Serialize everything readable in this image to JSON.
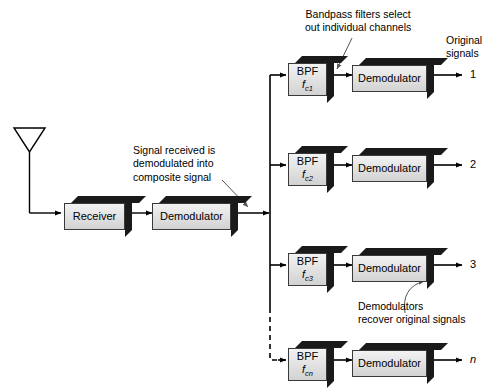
{
  "diagram": {
    "annotations": [
      {
        "id": "bandpass-note",
        "lines": [
          "Bandpass filters select",
          "out individual channels"
        ]
      },
      {
        "id": "original-signals-note",
        "lines": [
          "Original",
          "signals"
        ]
      },
      {
        "id": "received-signal-note",
        "lines": [
          "Signal received is",
          "demodulated into",
          "composite signal"
        ]
      },
      {
        "id": "demodulators-note",
        "lines": [
          "Demodulators",
          "recover original signals"
        ]
      }
    ],
    "blocks": {
      "receiver": {
        "label": "Receiver"
      },
      "main_demodulator": {
        "label": "Demodulator"
      }
    },
    "channels": [
      {
        "bpf_label": "BPF",
        "bpf_freq": "f",
        "bpf_freq_sub": "c1",
        "demodulator_label": "Demodulator",
        "output": "1",
        "output_italic": false,
        "dashed": false
      },
      {
        "bpf_label": "BPF",
        "bpf_freq": "f",
        "bpf_freq_sub": "c2",
        "demodulator_label": "Demodulator",
        "output": "2",
        "output_italic": false,
        "dashed": false
      },
      {
        "bpf_label": "BPF",
        "bpf_freq": "f",
        "bpf_freq_sub": "c3",
        "demodulator_label": "Demodulator",
        "output": "3",
        "output_italic": false,
        "dashed": false
      },
      {
        "bpf_label": "BPF",
        "bpf_freq": "f",
        "bpf_freq_sub": "cn",
        "demodulator_label": "Demodulator",
        "output": "n",
        "output_italic": true,
        "dashed": true
      }
    ],
    "colors": {
      "line": "#000000",
      "block_face_light": "#f2f2f2",
      "block_face_dark": "#d2d2d2",
      "block_extrude": "#1a1a1a",
      "leader": "#555555",
      "background": "#ffffff"
    }
  }
}
